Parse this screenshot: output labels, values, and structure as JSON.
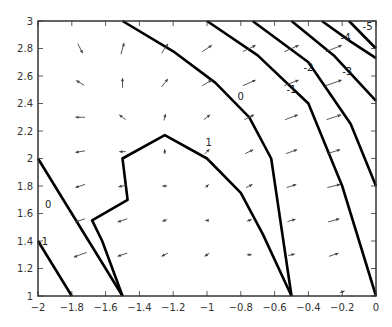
{
  "chart_data": {
    "type": "contour",
    "title": "",
    "xlabel": "",
    "ylabel": "",
    "xlim": [
      -2,
      0
    ],
    "ylim": [
      1,
      3
    ],
    "grid": false,
    "x_ticks": [
      "-2",
      "-1.8",
      "-1.6",
      "-1.4",
      "-1.2",
      "-1",
      "-0.8",
      "-0.6",
      "-0.4",
      "-0.2",
      "0"
    ],
    "y_ticks": [
      "1",
      "1.2",
      "1.4",
      "1.6",
      "1.8",
      "2",
      "2.2",
      "2.4",
      "2.6",
      "2.8",
      "3"
    ],
    "contour_levels": [
      {
        "level": "1",
        "label_pos": [
          -0.99,
          2.11
        ],
        "points": [
          [
            -1.5,
            1.0
          ],
          [
            -1.62,
            1.4
          ],
          [
            -1.68,
            1.55
          ],
          [
            -1.47,
            1.7
          ],
          [
            -1.5,
            2.0
          ],
          [
            -1.25,
            2.17
          ],
          [
            -1.0,
            2.0
          ],
          [
            -0.8,
            1.75
          ],
          [
            -0.67,
            1.45
          ],
          [
            -0.5,
            1.0
          ]
        ],
        "note": "closed region boundary with two branches ending on bottom axis"
      },
      {
        "level": "0",
        "label_pos": [
          -0.8,
          2.45
        ],
        "points": [
          [
            -1.5,
            3.0
          ],
          [
            -1.2,
            2.78
          ],
          [
            -0.95,
            2.55
          ],
          [
            -0.75,
            2.3
          ],
          [
            -0.62,
            2.0
          ],
          [
            -0.5,
            1.0
          ]
        ]
      },
      {
        "level": "0",
        "label_pos": [
          -1.94,
          1.66
        ],
        "points": [
          [
            -2.0,
            2.0
          ],
          [
            -1.85,
            1.7
          ],
          [
            -1.7,
            1.4
          ],
          [
            -1.5,
            1.0
          ]
        ]
      },
      {
        "level": "-1",
        "label_pos": [
          -0.5,
          2.5
        ],
        "points": [
          [
            -1.0,
            3.0
          ],
          [
            -0.7,
            2.75
          ],
          [
            -0.4,
            2.4
          ],
          [
            -0.2,
            1.8
          ],
          [
            0.0,
            1.0
          ]
        ]
      },
      {
        "level": "-1",
        "label_pos": [
          -1.97,
          1.39
        ],
        "points": [
          [
            -2.0,
            1.4
          ],
          [
            -1.9,
            1.2
          ],
          [
            -1.8,
            1.0
          ]
        ]
      },
      {
        "level": "-2",
        "label_pos": [
          -0.4,
          2.66
        ],
        "points": [
          [
            -0.73,
            3.0
          ],
          [
            -0.4,
            2.7
          ],
          [
            -0.15,
            2.25
          ],
          [
            0.0,
            1.8
          ]
        ]
      },
      {
        "level": "-3",
        "label_pos": [
          -0.17,
          2.63
        ],
        "points": [
          [
            -0.5,
            3.0
          ],
          [
            -0.25,
            2.75
          ],
          [
            0.0,
            2.42
          ]
        ]
      },
      {
        "level": "-4",
        "label_pos": [
          -0.18,
          2.88
        ],
        "points": [
          [
            -0.32,
            3.0
          ],
          [
            -0.15,
            2.85
          ],
          [
            0.0,
            2.73
          ]
        ]
      },
      {
        "level": "-5",
        "label_pos": [
          -0.05,
          2.96
        ],
        "points": [
          [
            -0.16,
            3.0
          ],
          [
            0.0,
            2.8
          ]
        ]
      }
    ],
    "quiver": [
      {
        "x": -1.75,
        "y": 2.8,
        "u": 0.3,
        "v": -0.6
      },
      {
        "x": -1.5,
        "y": 2.8,
        "u": 0.2,
        "v": 0.7
      },
      {
        "x": -1.25,
        "y": 2.8,
        "u": 0.4,
        "v": 0.6
      },
      {
        "x": -1.0,
        "y": 2.8,
        "u": 0.6,
        "v": 0.4
      },
      {
        "x": -0.75,
        "y": 2.8,
        "u": 0.8,
        "v": 0.4
      },
      {
        "x": -0.5,
        "y": 2.8,
        "u": 0.9,
        "v": 0.4
      },
      {
        "x": -0.25,
        "y": 2.8,
        "u": 1.0,
        "v": 0.4
      },
      {
        "x": -1.75,
        "y": 2.55,
        "u": -0.5,
        "v": 0.3
      },
      {
        "x": -1.5,
        "y": 2.55,
        "u": 0.0,
        "v": 0.6
      },
      {
        "x": -1.25,
        "y": 2.55,
        "u": 0.4,
        "v": 0.5
      },
      {
        "x": -1.0,
        "y": 2.55,
        "u": 0.6,
        "v": 0.35
      },
      {
        "x": -0.75,
        "y": 2.55,
        "u": 0.8,
        "v": 0.35
      },
      {
        "x": -0.5,
        "y": 2.55,
        "u": 0.9,
        "v": 0.35
      },
      {
        "x": -0.25,
        "y": 2.55,
        "u": 1.0,
        "v": 0.35
      },
      {
        "x": -1.75,
        "y": 2.3,
        "u": -0.6,
        "v": 0.0
      },
      {
        "x": -1.5,
        "y": 2.3,
        "u": -0.4,
        "v": 0.3
      },
      {
        "x": -1.25,
        "y": 2.3,
        "u": 0.1,
        "v": 0.4
      },
      {
        "x": -1.0,
        "y": 2.3,
        "u": 0.4,
        "v": 0.3
      },
      {
        "x": -0.75,
        "y": 2.3,
        "u": 0.6,
        "v": 0.3
      },
      {
        "x": -0.5,
        "y": 2.3,
        "u": 0.8,
        "v": 0.3
      },
      {
        "x": -0.25,
        "y": 2.3,
        "u": 0.9,
        "v": 0.3
      },
      {
        "x": -1.75,
        "y": 2.05,
        "u": -0.6,
        "v": -0.1
      },
      {
        "x": -1.5,
        "y": 2.05,
        "u": -0.4,
        "v": 0.0
      },
      {
        "x": -1.25,
        "y": 2.05,
        "u": 0.0,
        "v": 0.3
      },
      {
        "x": -1.0,
        "y": 2.05,
        "u": 0.3,
        "v": 0.3
      },
      {
        "x": -0.75,
        "y": 2.05,
        "u": 0.5,
        "v": 0.25
      },
      {
        "x": -0.5,
        "y": 2.05,
        "u": 0.7,
        "v": 0.25
      },
      {
        "x": -0.25,
        "y": 2.05,
        "u": 0.8,
        "v": 0.25
      },
      {
        "x": -1.75,
        "y": 1.8,
        "u": -0.6,
        "v": -0.2
      },
      {
        "x": -1.5,
        "y": 1.8,
        "u": -0.5,
        "v": -0.1
      },
      {
        "x": -1.25,
        "y": 1.8,
        "u": -0.3,
        "v": 0.0
      },
      {
        "x": -1.0,
        "y": 1.8,
        "u": 0.2,
        "v": 0.2
      },
      {
        "x": -0.75,
        "y": 1.8,
        "u": 0.4,
        "v": 0.2
      },
      {
        "x": -0.5,
        "y": 1.8,
        "u": 0.6,
        "v": 0.2
      },
      {
        "x": -0.25,
        "y": 1.8,
        "u": 0.8,
        "v": 0.2
      },
      {
        "x": -1.75,
        "y": 1.55,
        "u": -0.6,
        "v": -0.2
      },
      {
        "x": -1.5,
        "y": 1.55,
        "u": -0.6,
        "v": -0.2
      },
      {
        "x": -1.25,
        "y": 1.55,
        "u": -0.3,
        "v": -0.1
      },
      {
        "x": -1.0,
        "y": 1.55,
        "u": -0.2,
        "v": 0.0
      },
      {
        "x": -0.75,
        "y": 1.55,
        "u": 0.3,
        "v": 0.1
      },
      {
        "x": -0.5,
        "y": 1.55,
        "u": 0.5,
        "v": 0.15
      },
      {
        "x": -0.25,
        "y": 1.55,
        "u": 0.7,
        "v": 0.2
      },
      {
        "x": -1.75,
        "y": 1.3,
        "u": -0.8,
        "v": -0.3
      },
      {
        "x": -1.5,
        "y": 1.3,
        "u": -0.6,
        "v": -0.2
      },
      {
        "x": -1.25,
        "y": 1.3,
        "u": -0.4,
        "v": -0.2
      },
      {
        "x": -1.0,
        "y": 1.3,
        "u": -0.3,
        "v": -0.2
      },
      {
        "x": -0.75,
        "y": 1.3,
        "u": 0.3,
        "v": 0.0
      },
      {
        "x": -0.5,
        "y": 1.3,
        "u": 0.4,
        "v": 0.1
      },
      {
        "x": -0.25,
        "y": 1.3,
        "u": 0.6,
        "v": 0.2
      },
      {
        "x": -0.2,
        "y": 1.03,
        "u": 0.3,
        "v": 0.1
      }
    ]
  },
  "layout": {
    "plot": {
      "left": 38,
      "top": 21,
      "right": 376,
      "bottom": 296
    },
    "line_color": "#000000",
    "arrow_color": "#444444",
    "axis_color": "#333333"
  }
}
